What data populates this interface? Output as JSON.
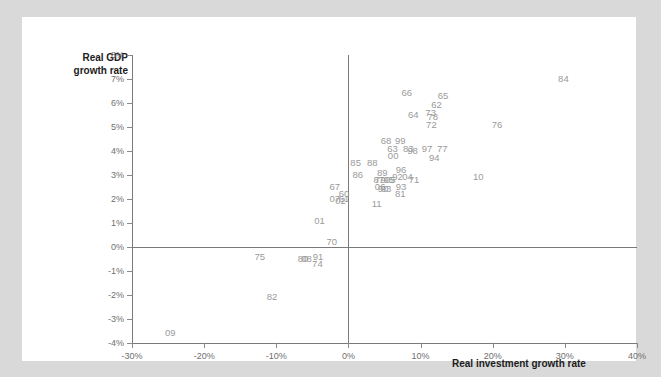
{
  "chart_data": {
    "type": "scatter",
    "title": "",
    "xlabel": "Real investment growth rate",
    "ylabel": "Real GDP growth rate",
    "xlim": [
      -30,
      40
    ],
    "ylim": [
      -4,
      8
    ],
    "xticks": [
      -30,
      -20,
      -10,
      0,
      10,
      20,
      30,
      40
    ],
    "xticklabels": [
      "-30%",
      "-20%",
      "-10%",
      "0%",
      "10%",
      "20%",
      "30%",
      "40%"
    ],
    "yticks": [
      -4,
      -3,
      -2,
      -1,
      0,
      1,
      2,
      3,
      4,
      5,
      6,
      7,
      8
    ],
    "yticklabels": [
      "-4%",
      "-3%",
      "-2%",
      "-1%",
      "0%",
      "1%",
      "2%",
      "3%",
      "4%",
      "5%",
      "6%",
      "7%",
      "8%"
    ],
    "grid": false,
    "legend": null,
    "marker_style": "text-label",
    "point_color": "#9a9a9a",
    "axis_color": "#7a7a7a",
    "panel_color": "#ffffff",
    "background_color": "#d9d9d9",
    "points": [
      {
        "label": "84",
        "x": 29.8,
        "y": 7.0
      },
      {
        "label": "66",
        "x": 8.1,
        "y": 6.4
      },
      {
        "label": "65",
        "x": 13.1,
        "y": 6.3
      },
      {
        "label": "62",
        "x": 12.2,
        "y": 5.9
      },
      {
        "label": "73",
        "x": 11.4,
        "y": 5.6
      },
      {
        "label": "78",
        "x": 11.7,
        "y": 5.4
      },
      {
        "label": "64",
        "x": 9.0,
        "y": 5.5
      },
      {
        "label": "72",
        "x": 11.5,
        "y": 5.1
      },
      {
        "label": "76",
        "x": 20.6,
        "y": 5.1
      },
      {
        "label": "68",
        "x": 5.2,
        "y": 4.4
      },
      {
        "label": "99",
        "x": 7.2,
        "y": 4.4
      },
      {
        "label": "63",
        "x": 6.1,
        "y": 4.1
      },
      {
        "label": "83",
        "x": 8.3,
        "y": 4.1
      },
      {
        "label": "98",
        "x": 8.9,
        "y": 4.0
      },
      {
        "label": "97",
        "x": 10.9,
        "y": 4.1
      },
      {
        "label": "77",
        "x": 13.0,
        "y": 4.1
      },
      {
        "label": "00",
        "x": 6.2,
        "y": 3.8
      },
      {
        "label": "94",
        "x": 11.9,
        "y": 3.7
      },
      {
        "label": "85",
        "x": 1.0,
        "y": 3.5
      },
      {
        "label": "88",
        "x": 3.3,
        "y": 3.5
      },
      {
        "label": "89",
        "x": 4.7,
        "y": 3.1
      },
      {
        "label": "96",
        "x": 7.3,
        "y": 3.2
      },
      {
        "label": "86",
        "x": 1.3,
        "y": 3.0
      },
      {
        "label": "92",
        "x": 6.8,
        "y": 2.9
      },
      {
        "label": "04",
        "x": 8.2,
        "y": 2.9
      },
      {
        "label": "71",
        "x": 9.1,
        "y": 2.8
      },
      {
        "label": "87",
        "x": 4.2,
        "y": 2.8
      },
      {
        "label": "79",
        "x": 4.4,
        "y": 2.8
      },
      {
        "label": "95",
        "x": 5.6,
        "y": 2.8
      },
      {
        "label": "05",
        "x": 5.8,
        "y": 2.8
      },
      {
        "label": "10",
        "x": 18.0,
        "y": 2.9
      },
      {
        "label": "06",
        "x": 4.4,
        "y": 2.5
      },
      {
        "label": "03",
        "x": 5.2,
        "y": 2.4
      },
      {
        "label": "93",
        "x": 7.3,
        "y": 2.5
      },
      {
        "label": "90",
        "x": 4.8,
        "y": 2.4
      },
      {
        "label": "67",
        "x": -1.9,
        "y": 2.5
      },
      {
        "label": "60",
        "x": -0.6,
        "y": 2.2
      },
      {
        "label": "81",
        "x": 7.2,
        "y": 2.2
      },
      {
        "label": "61",
        "x": -0.6,
        "y": 2.0
      },
      {
        "label": "07",
        "x": -1.9,
        "y": 2.0
      },
      {
        "label": "02",
        "x": -1.1,
        "y": 1.9
      },
      {
        "label": "11",
        "x": 3.9,
        "y": 1.8
      },
      {
        "label": "01",
        "x": -4.0,
        "y": 1.1
      },
      {
        "label": "70",
        "x": -2.3,
        "y": 0.2
      },
      {
        "label": "75",
        "x": -12.3,
        "y": -0.4
      },
      {
        "label": "91",
        "x": -4.2,
        "y": -0.4
      },
      {
        "label": "80",
        "x": -6.3,
        "y": -0.5
      },
      {
        "label": "08",
        "x": -5.8,
        "y": -0.5
      },
      {
        "label": "74",
        "x": -4.3,
        "y": -0.7
      },
      {
        "label": "82",
        "x": -10.6,
        "y": -2.1
      },
      {
        "label": "09",
        "x": -24.7,
        "y": -3.6
      }
    ]
  }
}
